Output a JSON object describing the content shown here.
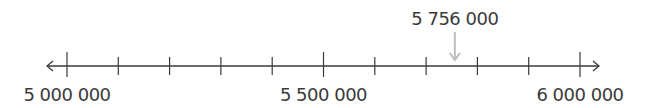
{
  "number_line": {
    "min": 5000000,
    "max": 6000000,
    "minor_step": 100000,
    "tick_count": 11,
    "labels": [
      {
        "value": 5000000,
        "text": "5 000 000"
      },
      {
        "value": 5500000,
        "text": "5 500 000"
      },
      {
        "value": 6000000,
        "text": "6 000 000"
      }
    ],
    "marker": {
      "value": 5756000,
      "text": "5 756 000",
      "color": "#bdbdbd"
    },
    "line_color": "#3a3a3a",
    "arrows": "both"
  },
  "chart_data": {
    "type": "number_line",
    "range": [
      5000000,
      6000000
    ],
    "ticks": [
      5000000,
      5100000,
      5200000,
      5300000,
      5400000,
      5500000,
      5600000,
      5700000,
      5800000,
      5900000,
      6000000
    ],
    "tick_labels": [
      "5 000 000",
      "5 500 000",
      "6 000 000"
    ],
    "annotations": [
      {
        "value": 5756000,
        "label": "5 756 000",
        "style": "down-arrow"
      }
    ]
  }
}
